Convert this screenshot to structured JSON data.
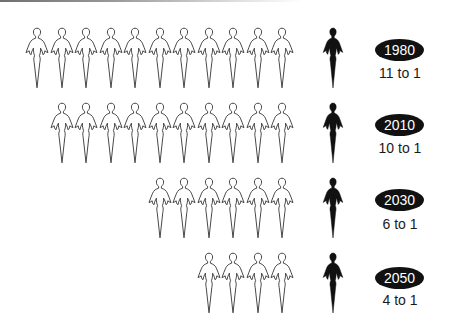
{
  "chart_data": {
    "type": "pictogram",
    "title": "",
    "categories": [
      "1980",
      "2010",
      "2030",
      "2050"
    ],
    "series": [
      {
        "name": "outline figures",
        "values": [
          11,
          10,
          6,
          4
        ]
      },
      {
        "name": "dark figures",
        "values": [
          1,
          1,
          1,
          1
        ]
      }
    ],
    "ratio_labels": [
      "11 to 1",
      "10 to 1",
      "6 to 1",
      "4 to 1"
    ]
  },
  "rows": [
    {
      "year": "1980",
      "ratio": "11 to 1",
      "count": 11
    },
    {
      "year": "2010",
      "ratio": "10 to 1",
      "count": 10
    },
    {
      "year": "2030",
      "ratio": "6 to 1",
      "count": 6
    },
    {
      "year": "2050",
      "ratio": "4 to 1",
      "count": 4
    }
  ],
  "colors": {
    "outline_stroke": "#333333",
    "dark_fill": "#111111",
    "oval_fill": "#111111",
    "oval_text": "#ffffff"
  }
}
